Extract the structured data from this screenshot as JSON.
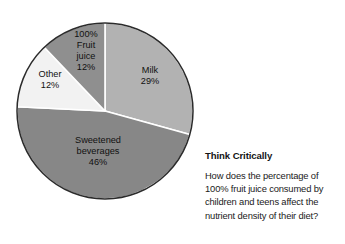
{
  "chart_data": {
    "type": "pie",
    "title": "",
    "subtitle": "",
    "xlabel": "",
    "ylabel": "",
    "legend_position": "none",
    "grid": false,
    "units": "percent",
    "start_angle_deg": 0,
    "direction": "clockwise",
    "categories": [
      "Milk",
      "Sweetened beverages",
      "Other",
      "100% Fruit juice"
    ],
    "values": [
      29,
      46,
      12,
      12
    ],
    "slices": [
      {
        "name": "Milk",
        "label_lines": [
          "Milk",
          "29%"
        ],
        "value": 29,
        "value_label": "29%",
        "color": "#b2b2b2",
        "label_x": 150,
        "label_y": 76
      },
      {
        "name": "Sweetened beverages",
        "label_lines": [
          "Sweetened",
          "beverages",
          "46%"
        ],
        "value": 46,
        "value_label": "46%",
        "color": "#878787",
        "label_x": 98,
        "label_y": 152
      },
      {
        "name": "Other",
        "label_lines": [
          "Other",
          "12%"
        ],
        "value": 12,
        "value_label": "12%",
        "color": "#f2f2f2",
        "label_x": 50,
        "label_y": 80
      },
      {
        "name": "100% Fruit juice",
        "label_lines": [
          "100%",
          "Fruit",
          "juice",
          "12%"
        ],
        "value": 12,
        "value_label": "12%",
        "color": "#8f8f8f",
        "label_x": 86,
        "label_y": 51
      }
    ],
    "geometry": {
      "center_x": 105,
      "center_y": 111,
      "radius": 88
    },
    "colors": {
      "outline": "#2b2b2b",
      "separator": "#ffffff",
      "background": "#ffffff",
      "text": "#111111"
    }
  },
  "side_panel": {
    "heading": "Think Critically",
    "question": "How does the percentage of 100% fruit juice consumed by children and teens affect the nutrient density of their diet?"
  }
}
